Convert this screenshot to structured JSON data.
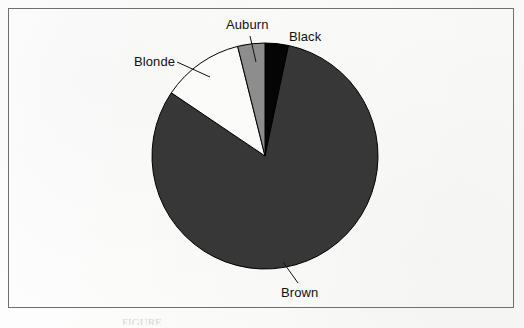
{
  "figure": {
    "frame_visible": true,
    "background_color": "#fdfdfc",
    "border_color": "#6e6e6e",
    "bottom_caption_fragment": "FIGURE"
  },
  "labels": {
    "auburn": "Auburn",
    "black": "Black",
    "blonde": "Blonde",
    "brown": "Brown"
  },
  "chart_data": {
    "type": "pie",
    "title": "",
    "subtitle": "",
    "xlabel": "",
    "ylabel": "",
    "legend_position": "none",
    "grid": false,
    "labels_placement": "outside-with-leader-lines",
    "start_angle_deg": -90,
    "direction": "clockwise",
    "center": {
      "x": 265,
      "y": 156
    },
    "radius": 113,
    "categories": [
      "Black",
      "Brown",
      "Blonde",
      "Auburn"
    ],
    "values": [
      3.3,
      81.1,
      11.7,
      3.9
    ],
    "value_unit": "percent",
    "slices": [
      {
        "name": "Black",
        "value": 3.3,
        "start_deg": -90,
        "end_deg": -78,
        "fill": "#050505",
        "stroke": "#000000",
        "label": "Black",
        "leader_line": false
      },
      {
        "name": "Brown",
        "value": 81.1,
        "start_deg": -78,
        "end_deg": 214,
        "fill": "#373737",
        "stroke": "#000000",
        "label": "Brown",
        "leader_line": true
      },
      {
        "name": "Blonde",
        "value": 11.7,
        "start_deg": 214,
        "end_deg": 256,
        "fill": "#fbfbf9",
        "stroke": "#000000",
        "label": "Blonde",
        "leader_line": true
      },
      {
        "name": "Auburn",
        "value": 3.9,
        "start_deg": 256,
        "end_deg": 270,
        "fill": "#8d8d8d",
        "stroke": "#000000",
        "label": "Auburn",
        "leader_line": true
      }
    ],
    "leader_lines": [
      {
        "name": "auburn-leader",
        "x1": 250,
        "y1": 36,
        "x2": 256,
        "y2": 62
      },
      {
        "name": "blonde-leader",
        "x1": 177,
        "y1": 62,
        "x2": 210,
        "y2": 77
      },
      {
        "name": "brown-leader",
        "x1": 298,
        "y1": 283,
        "x2": 283,
        "y2": 262
      }
    ]
  }
}
